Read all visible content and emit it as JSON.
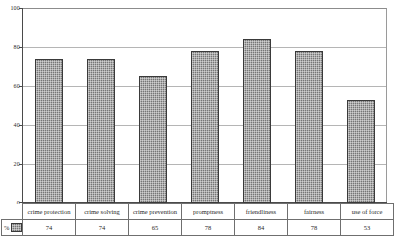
{
  "chart_data": {
    "type": "bar",
    "title": "",
    "xlabel": "",
    "ylabel": "",
    "ylim": [
      0,
      100
    ],
    "yticks": [
      0,
      20,
      40,
      60,
      80,
      100
    ],
    "grid": true,
    "legend_position": "bottom-left-table",
    "series_name": "%",
    "categories": [
      "crime protection",
      "crime solving",
      "crime prevention",
      "promptness",
      "friendliness",
      "fairness",
      "use of force"
    ],
    "values": [
      74,
      74,
      65,
      78,
      84,
      78,
      53
    ]
  },
  "axis": {
    "tick_100": "100",
    "tick_80": "80",
    "tick_60": "60",
    "tick_40": "40",
    "tick_20": "20",
    "tick_0": "0"
  },
  "table": {
    "legend_label": "%",
    "headers": [
      "crime protection",
      "crime solving",
      "crime prevention",
      "promptness",
      "friendliness",
      "fairness",
      "use of force"
    ],
    "values": [
      "74",
      "74",
      "65",
      "78",
      "84",
      "78",
      "53"
    ]
  },
  "colors": {
    "bar_fill": "#767676",
    "bar_border": "#3a3a3a",
    "gridline": "#b5b5b5",
    "axis": "#4a4a4a",
    "table_border": "#6f6f6f",
    "background": "#ffffff",
    "text": "#1f1f1f"
  }
}
